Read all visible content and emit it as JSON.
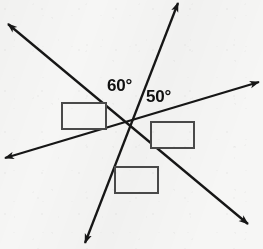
{
  "figure": {
    "background_color": "#f6f6f5",
    "line_color": "#161616",
    "box_stroke_color": "#4a4a4a",
    "box_fill_color": "#f6f6f5",
    "text_color": "#101010",
    "intersection": {
      "x": 128,
      "y": 126
    },
    "lines": [
      {
        "name": "line-a",
        "description": "diagonal line from upper-left to lower-right",
        "from": {
          "x": 8,
          "y": 24
        },
        "to": {
          "x": 248,
          "y": 224
        },
        "start_arrow": true,
        "end_arrow": true
      },
      {
        "name": "line-b",
        "description": "steep line from top to lower-left",
        "from": {
          "x": 178,
          "y": 3
        },
        "to": {
          "x": 85,
          "y": 243
        },
        "start_arrow": true,
        "end_arrow": true
      },
      {
        "name": "line-c",
        "description": "shallow line from lower-left to right",
        "from": {
          "x": 5,
          "y": 158
        },
        "to": {
          "x": 259,
          "y": 82
        },
        "start_arrow": true,
        "end_arrow": true
      }
    ],
    "angle_labels": [
      {
        "name": "angle-label-60",
        "text": "60°",
        "x": 107,
        "y": 77,
        "font_size": 17
      },
      {
        "name": "angle-label-50",
        "text": "50°",
        "x": 146,
        "y": 88,
        "font_size": 17
      }
    ],
    "answer_boxes": [
      {
        "name": "answer-box-left",
        "value": "",
        "x": 62,
        "y": 103,
        "width": 44,
        "height": 26
      },
      {
        "name": "answer-box-right",
        "value": "",
        "x": 151,
        "y": 122,
        "width": 43,
        "height": 26
      },
      {
        "name": "answer-box-bottom",
        "value": "",
        "x": 115,
        "y": 167,
        "width": 43,
        "height": 26
      }
    ]
  }
}
